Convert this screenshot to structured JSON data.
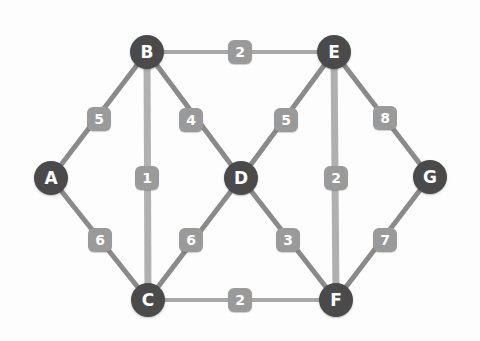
{
  "diagram": {
    "colors": {
      "node_fill": "#4a4a4a",
      "node_text": "#ffffff",
      "edge_diagonal": "#8a8a8a",
      "edge_vertical": "#b0b0b0",
      "edge_horizontal": "#a8a8a8",
      "weight_box": "#9a9a9a",
      "weight_text": "#ffffff",
      "background": "#fdfdfd"
    },
    "nodes": [
      {
        "id": "A",
        "label": "A",
        "x": 51,
        "y": 178
      },
      {
        "id": "B",
        "label": "B",
        "x": 147,
        "y": 52
      },
      {
        "id": "C",
        "label": "C",
        "x": 148,
        "y": 300
      },
      {
        "id": "D",
        "label": "D",
        "x": 241,
        "y": 178
      },
      {
        "id": "E",
        "label": "E",
        "x": 334,
        "y": 52
      },
      {
        "id": "F",
        "label": "F",
        "x": 336,
        "y": 300
      },
      {
        "id": "G",
        "label": "G",
        "x": 430,
        "y": 177
      }
    ],
    "edges": [
      {
        "id": "AB",
        "from": "A",
        "to": "B",
        "weight": "5",
        "lx": 99,
        "ly": 119,
        "style": "diagonal"
      },
      {
        "id": "AC",
        "from": "A",
        "to": "C",
        "weight": "6",
        "lx": 100,
        "ly": 240,
        "style": "diagonal"
      },
      {
        "id": "BE",
        "from": "B",
        "to": "E",
        "weight": "2",
        "lx": 240,
        "ly": 52,
        "style": "horizontal"
      },
      {
        "id": "BC",
        "from": "B",
        "to": "C",
        "weight": "1",
        "lx": 147,
        "ly": 178,
        "style": "vertical"
      },
      {
        "id": "BD",
        "from": "B",
        "to": "D",
        "weight": "4",
        "lx": 191,
        "ly": 120,
        "style": "diagonal"
      },
      {
        "id": "DE",
        "from": "D",
        "to": "E",
        "weight": "5",
        "lx": 286,
        "ly": 120,
        "style": "diagonal"
      },
      {
        "id": "EG",
        "from": "E",
        "to": "G",
        "weight": "8",
        "lx": 385,
        "ly": 118,
        "style": "diagonal"
      },
      {
        "id": "EF",
        "from": "E",
        "to": "F",
        "weight": "2",
        "lx": 336,
        "ly": 178,
        "style": "vertical"
      },
      {
        "id": "CD",
        "from": "C",
        "to": "D",
        "weight": "6",
        "lx": 191,
        "ly": 240,
        "style": "diagonal"
      },
      {
        "id": "DF",
        "from": "D",
        "to": "F",
        "weight": "3",
        "lx": 288,
        "ly": 240,
        "style": "diagonal"
      },
      {
        "id": "FG",
        "from": "F",
        "to": "G",
        "weight": "7",
        "lx": 385,
        "ly": 240,
        "style": "diagonal"
      },
      {
        "id": "CF",
        "from": "C",
        "to": "F",
        "weight": "2",
        "lx": 240,
        "ly": 300,
        "style": "horizontal"
      }
    ]
  }
}
